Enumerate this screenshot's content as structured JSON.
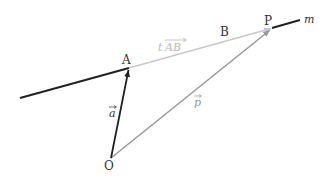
{
  "diagram": {
    "points": {
      "O": {
        "label": "O",
        "x": 111,
        "y": 158
      },
      "A": {
        "label": "A",
        "x": 129,
        "y": 68
      },
      "P": {
        "label": "P",
        "x": 272,
        "y": 28
      }
    },
    "labels": {
      "A": "A",
      "B": "B",
      "P": "P",
      "O": "O",
      "m": "m",
      "vec_a": "a",
      "vec_p": "p",
      "t_AB_t": "t",
      "t_AB_AB": "AB"
    },
    "line_m": {
      "name": "m",
      "color": "#222222",
      "segments": [
        {
          "from": [
            20,
            98
          ],
          "to": [
            129,
            68
          ]
        },
        {
          "from": [
            272,
            28
          ],
          "to": [
            300,
            20
          ]
        }
      ]
    },
    "vectors": [
      {
        "name": "a",
        "from": "O",
        "to": "A",
        "color": "#222222"
      },
      {
        "name": "p",
        "from": "O",
        "to": "P",
        "color": "#9a9a9a"
      },
      {
        "name": "tAB",
        "from": "A",
        "to": "P",
        "color": "#c8c8c8"
      }
    ],
    "colors": {
      "dark": "#222222",
      "mid_gray": "#9a9a9a",
      "light_gray": "#c8c8c8",
      "label": "#333333"
    }
  }
}
